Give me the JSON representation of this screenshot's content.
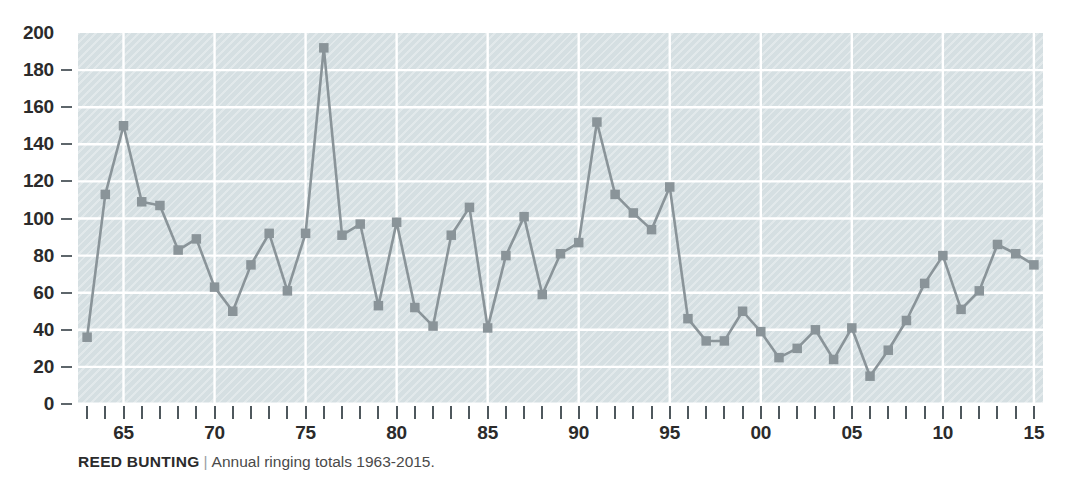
{
  "caption": {
    "species": "REED BUNTING",
    "separator": "|",
    "description": "Annual ringing totals 1963-2015."
  },
  "colors": {
    "plot_background": "#d5dfe2",
    "gridline": "#ffffff",
    "series": "#8a9499",
    "tick": "#4f585d",
    "label_text": "#2b2b2b",
    "caption_text": "#4a4a4a",
    "page_background": "#ffffff"
  },
  "chart_data": {
    "type": "line",
    "title": "REED BUNTING",
    "subtitle": "Annual ringing totals 1963-2015.",
    "xlabel": "",
    "ylabel": "",
    "xlim": [
      1962.5,
      2015.5
    ],
    "ylim": [
      0,
      200
    ],
    "grid": true,
    "legend": "none",
    "marker": "square",
    "y_ticks": [
      0,
      20,
      40,
      60,
      80,
      100,
      120,
      140,
      160,
      180,
      200
    ],
    "y_tick_labels": [
      "0",
      "20",
      "40",
      "60",
      "80",
      "100",
      "120",
      "140",
      "160",
      "180",
      "200"
    ],
    "x_tick_years": [
      1963,
      1964,
      1965,
      1966,
      1967,
      1968,
      1969,
      1970,
      1971,
      1972,
      1973,
      1974,
      1975,
      1976,
      1977,
      1978,
      1979,
      1980,
      1981,
      1982,
      1983,
      1984,
      1985,
      1986,
      1987,
      1988,
      1989,
      1990,
      1991,
      1992,
      1993,
      1994,
      1995,
      1996,
      1997,
      1998,
      1999,
      2000,
      2001,
      2002,
      2003,
      2004,
      2005,
      2006,
      2007,
      2008,
      2009,
      2010,
      2011,
      2012,
      2013,
      2014,
      2015
    ],
    "x_labeled_years": [
      1965,
      1970,
      1975,
      1980,
      1985,
      1990,
      1995,
      2000,
      2005,
      2010,
      2015
    ],
    "x_labels": [
      "65",
      "70",
      "75",
      "80",
      "85",
      "90",
      "95",
      "00",
      "05",
      "10",
      "15"
    ],
    "x": [
      1963,
      1964,
      1965,
      1966,
      1967,
      1968,
      1969,
      1970,
      1971,
      1972,
      1973,
      1974,
      1975,
      1976,
      1977,
      1978,
      1979,
      1980,
      1981,
      1982,
      1983,
      1984,
      1985,
      1986,
      1987,
      1988,
      1989,
      1990,
      1991,
      1992,
      1993,
      1994,
      1995,
      1996,
      1997,
      1998,
      1999,
      2000,
      2001,
      2002,
      2003,
      2004,
      2005,
      2006,
      2007,
      2008,
      2009,
      2010,
      2011,
      2012,
      2013,
      2014,
      2015
    ],
    "values": [
      36,
      113,
      150,
      109,
      107,
      83,
      89,
      63,
      50,
      75,
      92,
      61,
      92,
      192,
      91,
      97,
      53,
      98,
      52,
      42,
      91,
      106,
      41,
      80,
      101,
      59,
      81,
      87,
      152,
      113,
      103,
      94,
      117,
      46,
      34,
      34,
      50,
      39,
      25,
      30,
      40,
      24,
      41,
      15,
      29,
      45,
      65,
      80,
      51,
      61,
      86,
      81,
      75
    ]
  }
}
